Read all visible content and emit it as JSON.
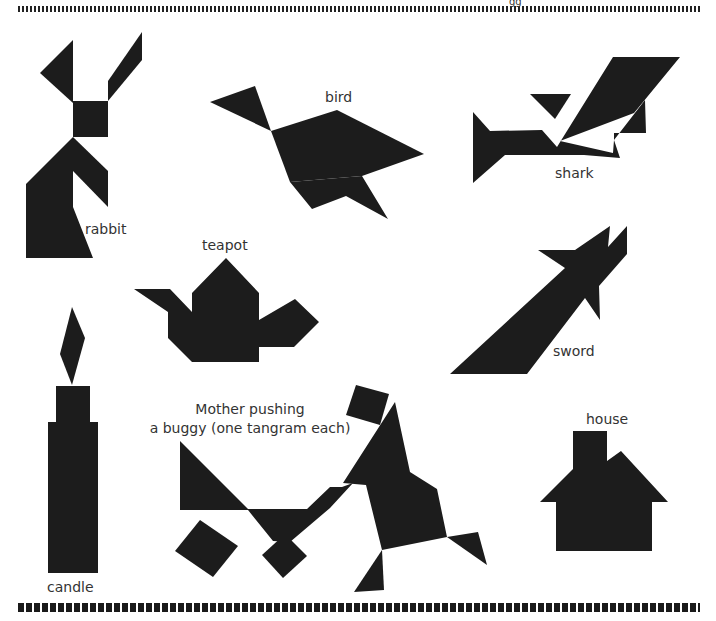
{
  "header": {
    "partial_text": "gg"
  },
  "figures": [
    {
      "id": "rabbit",
      "label": "rabbit"
    },
    {
      "id": "bird",
      "label": "bird"
    },
    {
      "id": "shark",
      "label": "shark"
    },
    {
      "id": "teapot",
      "label": "teapot"
    },
    {
      "id": "sword",
      "label": "sword"
    },
    {
      "id": "candle",
      "label": "candle"
    },
    {
      "id": "mother-buggy",
      "label_line1": "Mother pushing",
      "label_line2": "a buggy (one tangram each)"
    },
    {
      "id": "house",
      "label": "house"
    }
  ],
  "colors": {
    "shape": "#1c1c1c",
    "background": "#ffffff",
    "text": "#333333"
  }
}
